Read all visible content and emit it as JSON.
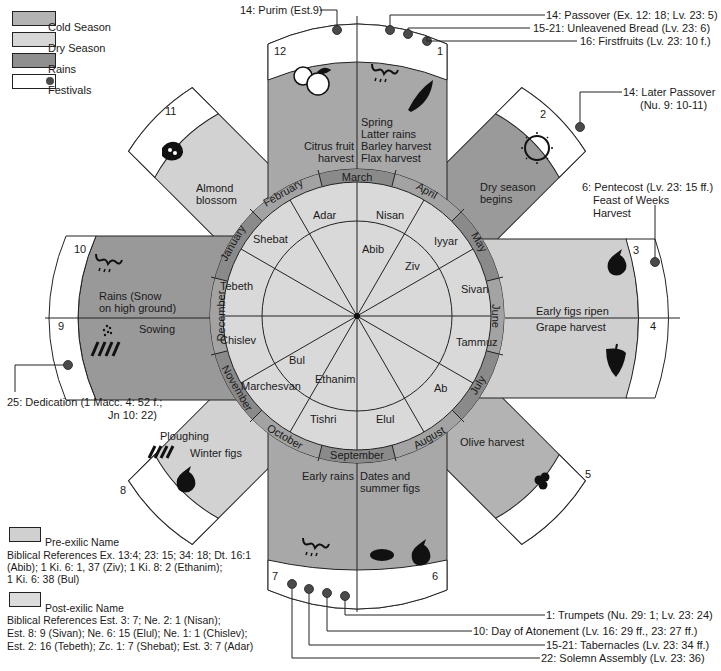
{
  "legend": {
    "items": [
      {
        "label": "Cold Season",
        "color": "#b3b3b3"
      },
      {
        "label": "Dry Season",
        "color": "#d4d4d4"
      },
      {
        "label": "Rains",
        "color": "#8f8f8f"
      },
      {
        "label": "Festivals",
        "color": "#ffffff",
        "marker_color": "#4a4a4a"
      }
    ]
  },
  "colors": {
    "cold": "#b3b3b3",
    "dry": "#d2d2d2",
    "rains": "#949494",
    "ring": "#8a8a8a",
    "ring_alt": "#9e9e9e",
    "inner_disc": "#d9d9d9",
    "festival_dot": "#4a4a4a",
    "line": "#222222"
  },
  "gregorian_months": [
    "March",
    "April",
    "May",
    "June",
    "July",
    "August",
    "September",
    "October",
    "November",
    "December",
    "January",
    "February"
  ],
  "post_exilic_months": [
    "Nisan",
    "Iyyar",
    "Sivan",
    "Tammuz",
    "Ab",
    "Elul",
    "Tishri",
    "Marchesvan",
    "Chislev",
    "Tebeth",
    "Shebat",
    "Adar"
  ],
  "pre_exilic_months": [
    "Abib",
    "Ziv",
    "Ethanim",
    "Bul"
  ],
  "month_numbers": [
    "1",
    "2",
    "3",
    "4",
    "5",
    "6",
    "7",
    "8",
    "9",
    "10",
    "11",
    "12"
  ],
  "seasons": {
    "m1": "Spring\nLatter rains\nBarley harvest\nFlax harvest",
    "m1_lines": [
      "Spring",
      "Latter rains",
      "Barley harvest",
      "Flax harvest"
    ],
    "m2_lines": [
      "Dry season",
      "begins"
    ],
    "m3": "Early figs ripen",
    "m4": "Grape harvest",
    "m5": "Olive harvest",
    "m6_lines": [
      "Dates and",
      "summer figs"
    ],
    "m7": "Early rains",
    "m8a": "Ploughing",
    "m8b": "Winter figs",
    "m9": "Sowing",
    "m10_lines": [
      "Rains (Snow",
      "on high ground)"
    ],
    "m11_lines": [
      "Almond",
      "blossom"
    ],
    "m12_lines": [
      "Citrus fruit",
      "harvest"
    ]
  },
  "festivals": {
    "purim": "14: Purim (Est.9)",
    "passover": "14: Passover (Ex. 12: 18; Lv. 23: 5)",
    "unleavened": "15-21: Unleavened Bread (Lv. 23: 6)",
    "firstfruits": "16: Firstfruits (Lv. 23: 10 f.)",
    "later_passover_1": "14: Later Passover",
    "later_passover_2": "(Nu. 9: 10-11)",
    "pentecost_1": "6: Pentecost (Lv. 23: 15 ff.)",
    "pentecost_2": "Feast of Weeks",
    "pentecost_3": "Harvest",
    "dedication_1": "25: Dedication (1 Macc. 4: 52 f.;",
    "dedication_2": "Jn 10: 22)",
    "trumpets": "1: Trumpets (Nu. 29: 1; Lv. 23: 24)",
    "atonement": "10: Day of Atonement (Lv. 16: 29 ff., 23: 27 ff.)",
    "tabernacles": "15-21: Tabernacles (Lv. 23: 34 ff.)",
    "solemn": "22: Solemn Assembly (Lv. 23: 36)"
  },
  "references": {
    "pre_label": "Pre-exilic Name",
    "pre_lines": [
      "Biblical References Ex. 13:4; 23: 15; 34: 18; Dt. 16:1",
      "(Abib); 1 Ki. 6: 1, 37 (Ziv); 1 Ki. 8: 2 (Ethanim);",
      "1 Ki. 6: 38 (Bul)"
    ],
    "post_label": "Post-exilic Name",
    "post_lines": [
      "Biblical References Est. 3: 7; Ne. 2: 1 (Nisan);",
      "Est. 8: 9 (Sivan); Ne. 6: 15 (Elul); Ne. 1: 1 (Chislev);",
      "Est. 2: 16 (Tebeth); Zc. 1: 7 (Shebat); Est. 3: 7 (Adar)"
    ]
  },
  "icons": {
    "m12": "citrus-icon",
    "m1": [
      "rain-cloud-icon",
      "barley-icon"
    ],
    "m2": "sun-icon",
    "m3": "fig-icon",
    "m4": "grapes-icon",
    "m5": "olives-icon",
    "m6": [
      "dates-icon",
      "fig-icon"
    ],
    "m7": "rain-cloud-icon",
    "m8": [
      "plough-icon",
      "fig-icon"
    ],
    "m9": [
      "seed-icon",
      "plough-icon"
    ],
    "m10": "rain-cloud-icon",
    "m11": "almond-blossom-icon"
  }
}
